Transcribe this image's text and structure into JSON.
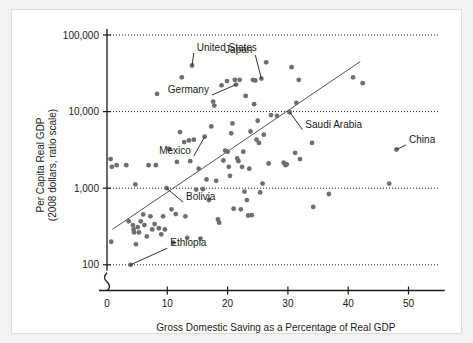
{
  "chart_data": {
    "type": "scatter",
    "title": "",
    "xlabel": "Gross Domestic Saving as a Percentage of Real GDP",
    "ylabel_line1": "Per Capita Real GDP",
    "ylabel_line2": "(2008 dollars, ratio scale)",
    "yscale": "log",
    "ylim": [
      100,
      100000
    ],
    "xlim": [
      0,
      56
    ],
    "grid": true,
    "grid_axis": "y",
    "legend": "none",
    "xticks": [
      0,
      10,
      20,
      30,
      40,
      50
    ],
    "xtick_labels": [
      "0",
      "10",
      "20",
      "30",
      "40",
      "50"
    ],
    "yticks": [
      100,
      1000,
      10000,
      100000
    ],
    "ytick_labels": [
      "100",
      "1,000",
      "10,000",
      "100,000"
    ],
    "axis_break": true,
    "points": [
      [
        0.6,
        2400
      ],
      [
        0.8,
        1900
      ],
      [
        1.6,
        2000
      ],
      [
        0.7,
        200
      ],
      [
        3.2,
        2000
      ],
      [
        3.6,
        370
      ],
      [
        3.9,
        100
      ],
      [
        4.3,
        330
      ],
      [
        4.4,
        290
      ],
      [
        4.5,
        265
      ],
      [
        4.7,
        1120
      ],
      [
        4.8,
        185
      ],
      [
        5.1,
        310
      ],
      [
        5.3,
        265
      ],
      [
        5.6,
        370
      ],
      [
        6.0,
        455
      ],
      [
        6.2,
        330
      ],
      [
        6.6,
        235
      ],
      [
        6.9,
        2000
      ],
      [
        7.2,
        430
      ],
      [
        7.5,
        290
      ],
      [
        7.9,
        340
      ],
      [
        8.1,
        2000
      ],
      [
        8.3,
        17000
      ],
      [
        8.6,
        300
      ],
      [
        9.0,
        250
      ],
      [
        9.3,
        430
      ],
      [
        9.6,
        290
      ],
      [
        9.9,
        1000
      ],
      [
        10.3,
        3250
      ],
      [
        10.7,
        530
      ],
      [
        11.0,
        195
      ],
      [
        11.4,
        460
      ],
      [
        11.6,
        2200
      ],
      [
        12.1,
        5400
      ],
      [
        12.4,
        28000
      ],
      [
        12.8,
        4000
      ],
      [
        13.0,
        430
      ],
      [
        13.3,
        225
      ],
      [
        13.6,
        4200
      ],
      [
        13.8,
        2250
      ],
      [
        14.1,
        40000
      ],
      [
        14.4,
        4300
      ],
      [
        14.8,
        960
      ],
      [
        15.2,
        1800
      ],
      [
        15.5,
        220
      ],
      [
        15.9,
        970
      ],
      [
        16.2,
        4700
      ],
      [
        16.5,
        1300
      ],
      [
        16.9,
        700
      ],
      [
        17.3,
        6400
      ],
      [
        17.6,
        13500
      ],
      [
        17.8,
        12000
      ],
      [
        18.1,
        1250
      ],
      [
        18.4,
        390
      ],
      [
        18.6,
        355
      ],
      [
        19.0,
        22000
      ],
      [
        19.3,
        2300
      ],
      [
        19.6,
        3100
      ],
      [
        19.9,
        25000
      ],
      [
        20.0,
        3000
      ],
      [
        20.2,
        1900
      ],
      [
        20.4,
        1450
      ],
      [
        20.6,
        5200
      ],
      [
        20.8,
        7000
      ],
      [
        21.0,
        540
      ],
      [
        21.2,
        26000
      ],
      [
        21.4,
        22500
      ],
      [
        21.6,
        2450
      ],
      [
        21.8,
        2250
      ],
      [
        22.0,
        26000
      ],
      [
        22.2,
        530
      ],
      [
        22.4,
        1900
      ],
      [
        22.6,
        3000
      ],
      [
        22.8,
        900
      ],
      [
        23.0,
        16000
      ],
      [
        23.2,
        700
      ],
      [
        23.4,
        440
      ],
      [
        23.6,
        1800
      ],
      [
        23.8,
        5500
      ],
      [
        24.0,
        445
      ],
      [
        24.2,
        26000
      ],
      [
        24.4,
        12500
      ],
      [
        24.6,
        25500
      ],
      [
        24.8,
        4300
      ],
      [
        25.0,
        7600
      ],
      [
        25.2,
        3900
      ],
      [
        25.4,
        880
      ],
      [
        25.6,
        27000
      ],
      [
        25.8,
        1150
      ],
      [
        26.0,
        5000
      ],
      [
        26.4,
        44000
      ],
      [
        26.8,
        2100
      ],
      [
        27.2,
        9000
      ],
      [
        28.2,
        8800
      ],
      [
        29.3,
        2150
      ],
      [
        29.6,
        2000
      ],
      [
        29.8,
        2050
      ],
      [
        30.3,
        9800
      ],
      [
        30.6,
        38000
      ],
      [
        31.2,
        2900
      ],
      [
        31.4,
        13000
      ],
      [
        31.8,
        26000
      ],
      [
        32.0,
        2400
      ],
      [
        34.0,
        3900
      ],
      [
        34.2,
        570
      ],
      [
        36.8,
        840
      ],
      [
        40.8,
        28000
      ],
      [
        42.4,
        23500
      ],
      [
        46.8,
        1150
      ],
      [
        48.0,
        3200
      ]
    ],
    "trend_line": {
      "x_start": 0.9,
      "y_start": 290,
      "x_end": 42.0,
      "y_end": 45000
    },
    "annotations": [
      {
        "name": "united-states",
        "label": "United States",
        "label_x": 14.4,
        "label_y": 62000,
        "point_x": 14.1,
        "point_y": 40000
      },
      {
        "name": "japan",
        "label": "Japan",
        "label_x": 24.6,
        "label_y": 58000,
        "point_x": 25.6,
        "point_y": 27000
      },
      {
        "name": "germany",
        "label": "Germany",
        "label_x": 17.4,
        "label_y": 17500,
        "point_x": 21.4,
        "point_y": 22500
      },
      {
        "name": "saudi-arabia",
        "label": "Saudi Arabia",
        "label_x": 32.4,
        "label_y": 6200,
        "point_x": 30.3,
        "point_y": 9800
      },
      {
        "name": "china",
        "label": "China",
        "label_x": 49.6,
        "label_y": 3900,
        "point_x": 48.0,
        "point_y": 3200
      },
      {
        "name": "mexico",
        "label": "Mexico",
        "label_x": 14.4,
        "label_y": 2800,
        "point_x": 16.2,
        "point_y": 4700
      },
      {
        "name": "bolivia",
        "label": "Bolivia",
        "label_x": 12.6,
        "label_y": 700,
        "point_x": 9.9,
        "point_y": 1000
      },
      {
        "name": "ethiopia",
        "label": "Ethiopia",
        "label_x": 10.0,
        "label_y": 175,
        "point_x": 3.9,
        "point_y": 100
      }
    ]
  }
}
